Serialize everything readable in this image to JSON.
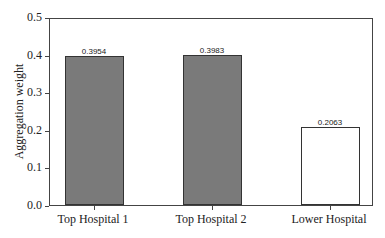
{
  "chart_data": {
    "type": "bar",
    "title": "",
    "xlabel": "",
    "ylabel": "Aggregation weight",
    "ylim": [
      0,
      0.5
    ],
    "yticks": [
      "0.0",
      "0.1",
      "0.2",
      "0.3",
      "0.4",
      "0.5"
    ],
    "categories": [
      "Top Hospital 1",
      "Top Hospital 2",
      "Lower Hospital"
    ],
    "values": [
      0.3954,
      0.3983,
      0.2063
    ],
    "value_labels": [
      "0.3954",
      "0.3983",
      "0.2063"
    ],
    "bar_fills": [
      "#7a7a7a",
      "#7a7a7a",
      "#ffffff"
    ],
    "grid": false,
    "legend": null
  }
}
